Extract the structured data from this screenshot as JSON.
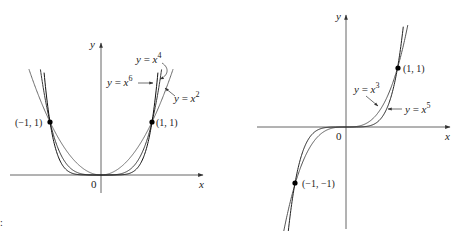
{
  "chart_data": [
    {
      "type": "line",
      "title": "Even power functions",
      "xlabel": "x",
      "ylabel": "y",
      "origin_label": "0",
      "series": [
        {
          "name": "y = x^2",
          "label": "y = x",
          "exp": "2",
          "power": 2,
          "color": "#6a6a6a"
        },
        {
          "name": "y = x^4",
          "label": "y = x",
          "exp": "4",
          "power": 4,
          "color": "#3a3a3a"
        },
        {
          "name": "y = x^6",
          "label": "y = x",
          "exp": "6",
          "power": 6,
          "color": "#111111"
        }
      ],
      "points": [
        {
          "x": -1,
          "y": 1,
          "label": "(−1, 1)"
        },
        {
          "x": 1,
          "y": 1,
          "label": "(1, 1)"
        }
      ],
      "xlim": [
        -1.8,
        2.0
      ],
      "ylim": [
        -0.4,
        2.5
      ],
      "grid": false
    },
    {
      "type": "line",
      "title": "Odd power functions",
      "xlabel": "x",
      "ylabel": "y",
      "origin_label": "0",
      "series": [
        {
          "name": "y = x^3",
          "label": "y = x",
          "exp": "3",
          "power": 3,
          "color": "#555555"
        },
        {
          "name": "y = x^5",
          "label": "y = x",
          "exp": "5",
          "power": 5,
          "color": "#222222"
        }
      ],
      "points": [
        {
          "x": 1,
          "y": 1,
          "label": "(1, 1)"
        },
        {
          "x": -1,
          "y": -1,
          "label": "(−1, −1)"
        }
      ],
      "xlim": [
        -1.7,
        2.0
      ],
      "ylim": [
        -1.7,
        1.9
      ],
      "grid": false
    }
  ]
}
